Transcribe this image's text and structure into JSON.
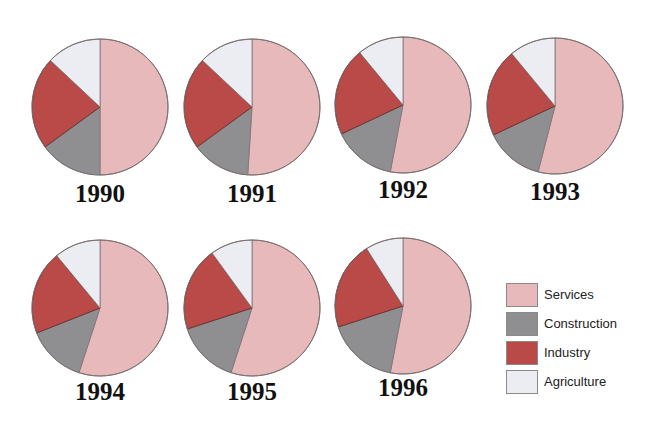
{
  "chart_data": {
    "type": "pie",
    "title": "",
    "slice_order": [
      "Services",
      "Construction",
      "Industry",
      "Agriculture"
    ],
    "legend": [
      {
        "label": "Services",
        "color": "#e8b9bb"
      },
      {
        "label": "Construction",
        "color": "#8f8e91"
      },
      {
        "label": "Industry",
        "color": "#b94a48"
      },
      {
        "label": "Agriculture",
        "color": "#ecedf2"
      }
    ],
    "legend_position": "right-bottom",
    "charts": [
      {
        "year": "1990",
        "values": {
          "Services": 50,
          "Construction": 15,
          "Industry": 22,
          "Agriculture": 13
        }
      },
      {
        "year": "1991",
        "values": {
          "Services": 51,
          "Construction": 14,
          "Industry": 22,
          "Agriculture": 13
        }
      },
      {
        "year": "1992",
        "values": {
          "Services": 53,
          "Construction": 15,
          "Industry": 21,
          "Agriculture": 11
        }
      },
      {
        "year": "1993",
        "values": {
          "Services": 54,
          "Construction": 14,
          "Industry": 21,
          "Agriculture": 11
        }
      },
      {
        "year": "1994",
        "values": {
          "Services": 55,
          "Construction": 14,
          "Industry": 20,
          "Agriculture": 11
        }
      },
      {
        "year": "1995",
        "values": {
          "Services": 55,
          "Construction": 15,
          "Industry": 20,
          "Agriculture": 10
        }
      },
      {
        "year": "1996",
        "values": {
          "Services": 53,
          "Construction": 17,
          "Industry": 21,
          "Agriculture": 9
        }
      }
    ]
  },
  "layout": {
    "pies": [
      {
        "cx": 100,
        "cy": 107,
        "label_top": 180
      },
      {
        "cx": 252,
        "cy": 107,
        "label_top": 180
      },
      {
        "cx": 403,
        "cy": 105,
        "label_top": 176
      },
      {
        "cx": 555,
        "cy": 106,
        "label_top": 178
      },
      {
        "cx": 100,
        "cy": 308,
        "label_top": 378
      },
      {
        "cx": 252,
        "cy": 308,
        "label_top": 378
      },
      {
        "cx": 403,
        "cy": 306,
        "label_top": 374
      }
    ],
    "radius": 68
  }
}
